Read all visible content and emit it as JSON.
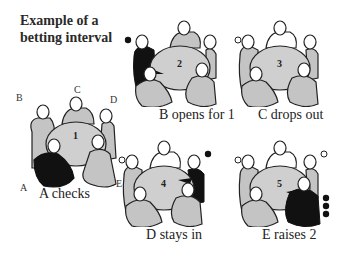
{
  "title": {
    "line1": "Example of a",
    "line2": "betting interval"
  },
  "colors": {
    "active_fill": "#111111",
    "seated_fill": "#c4c4c4",
    "dropped_fill": "#ffffff",
    "table_fill": "#cfcfcf",
    "outline": "#222222"
  },
  "seat_letters": {
    "A": "A",
    "B": "B",
    "C": "C",
    "D": "D",
    "E": "E"
  },
  "panels": [
    {
      "table_number": "1",
      "caption_letter": "A",
      "caption_text": " checks",
      "active_player": "A",
      "dropped": [],
      "chips": {}
    },
    {
      "table_number": "2",
      "caption_letter": "B",
      "caption_text": " opens for 1",
      "active_player": "B",
      "dropped": [],
      "chips": {
        "B": 1
      }
    },
    {
      "table_number": "3",
      "caption_letter": "C",
      "caption_text": " drops out",
      "active_player": "C",
      "dropped": [
        "C"
      ],
      "chips": {
        "B": 1
      }
    },
    {
      "table_number": "4",
      "caption_letter": "D",
      "caption_text": " stays in",
      "active_player": "D",
      "dropped": [
        "C"
      ],
      "chips": {
        "B": 1,
        "D": 1
      }
    },
    {
      "table_number": "5",
      "caption_letter": "E",
      "caption_text": " raises 2",
      "active_player": "E",
      "dropped": [
        "C"
      ],
      "chips": {
        "B": 1,
        "D": 1,
        "E": 3
      }
    }
  ]
}
